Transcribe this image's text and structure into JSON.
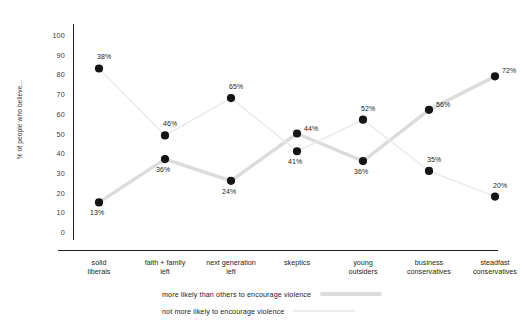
{
  "chart_data": {
    "type": "line",
    "title": "",
    "xlabel": "",
    "ylabel": "% of people who believe...",
    "ylim": [
      0,
      100
    ],
    "ytick_step": 10,
    "grid": false,
    "legend_position": "bottom",
    "categories": [
      "solid\nliberals",
      "faith + family\nleft",
      "next generation\nleft",
      "skeptics",
      "young\noutsiders",
      "business\nconservatives",
      "steadfast\nconservatives"
    ],
    "yticks": [
      "100",
      "90",
      "80",
      "70",
      "60",
      "50",
      "40",
      "30",
      "20",
      "10",
      "0"
    ],
    "series": [
      {
        "name": "more likely than others to encourage violence",
        "color": "#dcdcdc",
        "line_width": 3.4,
        "marker_color": "#151515",
        "values": [
          13,
          36,
          24,
          44,
          36,
          56,
          72
        ],
        "labels": [
          "13%",
          "36%",
          "24%",
          "44%",
          "36%",
          "56%",
          "72%"
        ],
        "plot_positions": [
          15,
          37,
          26,
          50,
          36,
          62,
          79
        ],
        "label_offsets": [
          "below",
          "below",
          "below",
          "right",
          "below",
          "right",
          "right"
        ]
      },
      {
        "name": "not more likely to encourage violence",
        "color": "#ececec",
        "line_width": 1.6,
        "marker_color": "#151515",
        "values": [
          38,
          46,
          65,
          41,
          52,
          35,
          20
        ],
        "labels": [
          "38%",
          "46%",
          "65%",
          "41%",
          "52%",
          "35%",
          "20%"
        ],
        "plot_positions": [
          83,
          49,
          68,
          41,
          57,
          31,
          18
        ],
        "label_offsets": [
          "above",
          "above",
          "above",
          "below",
          "above",
          "above",
          "above"
        ]
      }
    ]
  },
  "legend": {
    "entries": [
      {
        "label": "more likely than others to encourage violence",
        "swatch": "thick"
      },
      {
        "label": "not more likely to encourage violence",
        "swatch": "thin"
      }
    ]
  }
}
